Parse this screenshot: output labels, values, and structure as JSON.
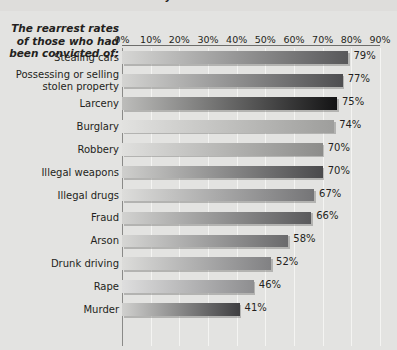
{
  "caption": {
    "clipped_text": "rearrested within three years?"
  },
  "row_header": {
    "line1": "The rearrest rates",
    "line2": "of those who had",
    "line3": "been convicted of:"
  },
  "axis": {
    "ticks": [
      "0%",
      "10%",
      "20%",
      "30%",
      "40%",
      "50%",
      "60%",
      "70%",
      "80%",
      "90%"
    ],
    "min": 0,
    "max": 90
  },
  "colors": {
    "page_background": "#e3e3e1",
    "plot_background": "#e3e3e1",
    "gridline": "#f4f4f2",
    "axis_line": "#8a8a88",
    "text": "#231f20"
  },
  "chart_data": {
    "type": "bar",
    "orientation": "horizontal",
    "title": "",
    "xlabel": "",
    "ylabel": "",
    "xlim": [
      0,
      90
    ],
    "grid": true,
    "legend": "none",
    "categories": [
      "Stealing cars",
      "Possessing or selling stolen property",
      "Larceny",
      "Burglary",
      "Robbery",
      "Illegal weapons",
      "Illegal drugs",
      "Fraud",
      "Arson",
      "Drunk driving",
      "Rape",
      "Murder"
    ],
    "values": [
      79,
      77,
      75,
      74,
      70,
      70,
      67,
      66,
      58,
      52,
      46,
      41
    ],
    "labels": [
      "79%",
      "77%",
      "75%",
      "74%",
      "70%",
      "70%",
      "67%",
      "66%",
      "58%",
      "52%",
      "46%",
      "41%"
    ],
    "bar_gradients": [
      [
        "#d6d6d4",
        "#58585a"
      ],
      [
        "#d4d4d2",
        "#4e4e50"
      ],
      [
        "#bdbdbb",
        "#131314"
      ],
      [
        "#e2e2e0",
        "#9e9e9c"
      ],
      [
        "#e0e0de",
        "#8c8c8a"
      ],
      [
        "#cfcfcd",
        "#4a4a4c"
      ],
      [
        "#dddddb",
        "#757577"
      ],
      [
        "#d2d2d0",
        "#5a5a5c"
      ],
      [
        "#d6d6d4",
        "#6a6a6c"
      ],
      [
        "#dcdcda",
        "#818183"
      ],
      [
        "#dedede",
        "#8e8e90"
      ],
      [
        "#d0d0ce",
        "#3f3f41"
      ]
    ]
  }
}
